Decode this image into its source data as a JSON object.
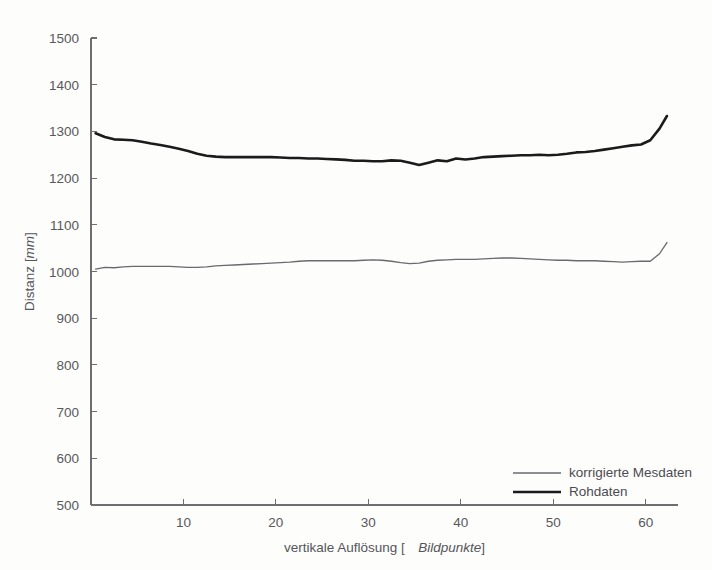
{
  "chart_data": {
    "type": "line",
    "title": "",
    "xlabel_prefix": "vertikale Auflösung [",
    "xlabel_unit": "Bildpunkte",
    "xlabel_suffix": "]",
    "ylabel_prefix": "Distanz [",
    "ylabel_unit": "mm",
    "ylabel_suffix": "]",
    "xlim": [
      0,
      63.5
    ],
    "ylim": [
      500,
      1500
    ],
    "xticks": [
      10,
      20,
      30,
      40,
      50,
      60
    ],
    "xtick_labels": [
      "10",
      "20",
      "30",
      "40",
      "50",
      "60"
    ],
    "yticks": [
      500,
      600,
      700,
      800,
      900,
      1000,
      1100,
      1200,
      1300,
      1400,
      1500
    ],
    "ytick_labels": [
      "500",
      "600",
      "700",
      "800",
      "900",
      "1000",
      "1100",
      "1200",
      "1300",
      "1400",
      "1500"
    ],
    "grid": false,
    "legend_position": "lower right",
    "legend_entries": [
      "korrigierte Mesdaten",
      "Rohdaten"
    ],
    "colors": {
      "raw": "#1b1b1b",
      "corrected": "#6a6a6e",
      "axis": "#6e6e72",
      "text": "#55555a",
      "background": "#fdfdfc"
    },
    "x": [
      0.5,
      1.5,
      2.5,
      3.5,
      4.5,
      5.5,
      6.5,
      7.5,
      8.5,
      9.5,
      10.5,
      11.5,
      12.5,
      13.5,
      14.5,
      15.5,
      16.5,
      17.5,
      18.5,
      19.5,
      20.5,
      21.5,
      22.5,
      23.5,
      24.5,
      25.5,
      26.5,
      27.5,
      28.5,
      29.5,
      30.5,
      31.5,
      32.5,
      33.5,
      34.5,
      35.5,
      36.5,
      37.5,
      38.5,
      39.5,
      40.5,
      41.5,
      42.5,
      43.5,
      44.5,
      45.5,
      46.5,
      47.5,
      48.5,
      49.5,
      50.5,
      51.5,
      52.5,
      53.5,
      54.5,
      55.5,
      56.5,
      57.5,
      58.5,
      59.5,
      60.5,
      61.5,
      62.3
    ],
    "series": [
      {
        "name": "Rohdaten",
        "style": "thick-black",
        "values": [
          1296,
          1288,
          1283,
          1282,
          1281,
          1278,
          1274,
          1271,
          1267,
          1263,
          1258,
          1252,
          1248,
          1246,
          1245,
          1245,
          1245,
          1245,
          1245,
          1245,
          1244,
          1243,
          1243,
          1242,
          1242,
          1241,
          1240,
          1239,
          1237,
          1237,
          1236,
          1236,
          1238,
          1237,
          1233,
          1228,
          1233,
          1238,
          1236,
          1242,
          1240,
          1242,
          1245,
          1246,
          1247,
          1248,
          1249,
          1249,
          1250,
          1249,
          1250,
          1252,
          1255,
          1256,
          1258,
          1261,
          1264,
          1267,
          1270,
          1272,
          1281,
          1306,
          1333
        ]
      },
      {
        "name": "korrigierte Mesdaten",
        "style": "thin-gray",
        "values": [
          1005,
          1009,
          1008,
          1010,
          1011,
          1011,
          1011,
          1011,
          1011,
          1010,
          1009,
          1009,
          1010,
          1012,
          1013,
          1014,
          1015,
          1016,
          1017,
          1018,
          1019,
          1020,
          1022,
          1023,
          1023,
          1023,
          1023,
          1023,
          1023,
          1024,
          1025,
          1024,
          1022,
          1019,
          1017,
          1018,
          1022,
          1024,
          1025,
          1026,
          1026,
          1026,
          1027,
          1028,
          1029,
          1029,
          1028,
          1027,
          1026,
          1025,
          1024,
          1024,
          1023,
          1023,
          1023,
          1022,
          1021,
          1020,
          1021,
          1022,
          1022,
          1038,
          1062
        ]
      }
    ]
  },
  "figure": {
    "caption": ""
  }
}
